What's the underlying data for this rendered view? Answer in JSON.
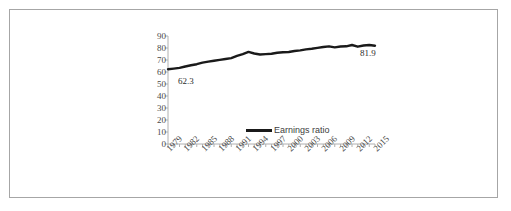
{
  "chart_data": {
    "type": "line",
    "title": "",
    "xlabel": "",
    "ylabel": "",
    "ylim": [
      0,
      90
    ],
    "grid": false,
    "legend_position": "bottom-center",
    "y_ticks": [
      90,
      80,
      70,
      60,
      50,
      40,
      30,
      20,
      10,
      0
    ],
    "x_tick_labels": [
      "1979",
      "1982",
      "1985",
      "1988",
      "1991",
      "1994",
      "1997",
      "2000",
      "2003",
      "2006",
      "2009",
      "2012",
      "2015"
    ],
    "annotations": [
      {
        "text": "62.3",
        "x": "1979",
        "value": 62.3
      },
      {
        "text": "81.9",
        "x": "2015",
        "value": 81.9
      }
    ],
    "series": [
      {
        "name": "Earnings ratio",
        "color": "#1a1a1a",
        "x": [
          1979,
          1980,
          1981,
          1982,
          1983,
          1984,
          1985,
          1986,
          1987,
          1988,
          1989,
          1990,
          1991,
          1992,
          1993,
          1994,
          1995,
          1996,
          1997,
          1998,
          1999,
          2000,
          2001,
          2002,
          2003,
          2004,
          2005,
          2006,
          2007,
          2008,
          2009,
          2010,
          2011,
          2012,
          2013,
          2014,
          2015
        ],
        "values": [
          62.3,
          62.8,
          63.4,
          64.6,
          65.6,
          66.5,
          67.8,
          68.6,
          69.4,
          70.1,
          70.8,
          71.6,
          73.4,
          74.9,
          76.7,
          75.4,
          74.6,
          74.9,
          75.2,
          76.0,
          76.5,
          76.7,
          77.5,
          78.0,
          78.9,
          79.4,
          80.1,
          80.8,
          81.4,
          80.5,
          81.2,
          81.4,
          82.5,
          81.1,
          82.1,
          82.5,
          81.9
        ]
      }
    ]
  },
  "legend": {
    "items": [
      {
        "label": "Earnings ratio",
        "color": "#1a1a1a"
      }
    ]
  }
}
